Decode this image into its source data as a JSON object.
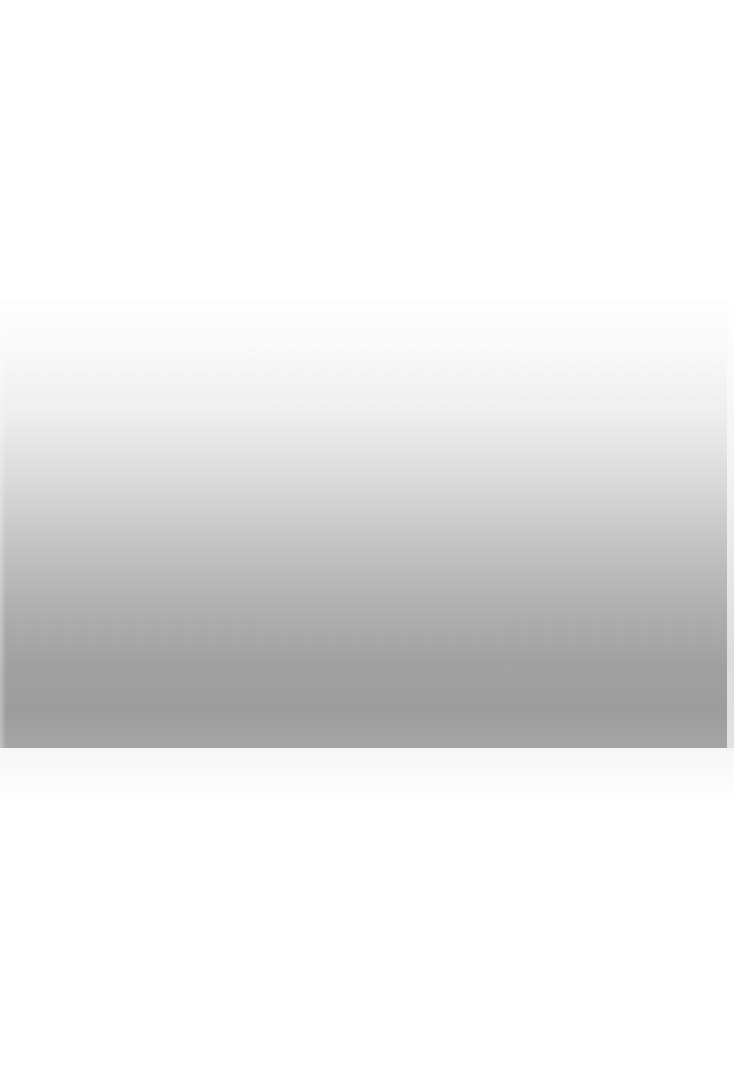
{
  "page": {
    "description": "Blank page with a vertical gray gradient band; no legible text or UI controls visible"
  },
  "colors": {
    "background": "#ffffff",
    "band_top": "#ffffff",
    "band_mid": "#c4c4c4",
    "band_darkest": "#9e9e9e",
    "band_bottom_edge": "#a6a6a6",
    "lower_strip": "#f7f7f7"
  }
}
